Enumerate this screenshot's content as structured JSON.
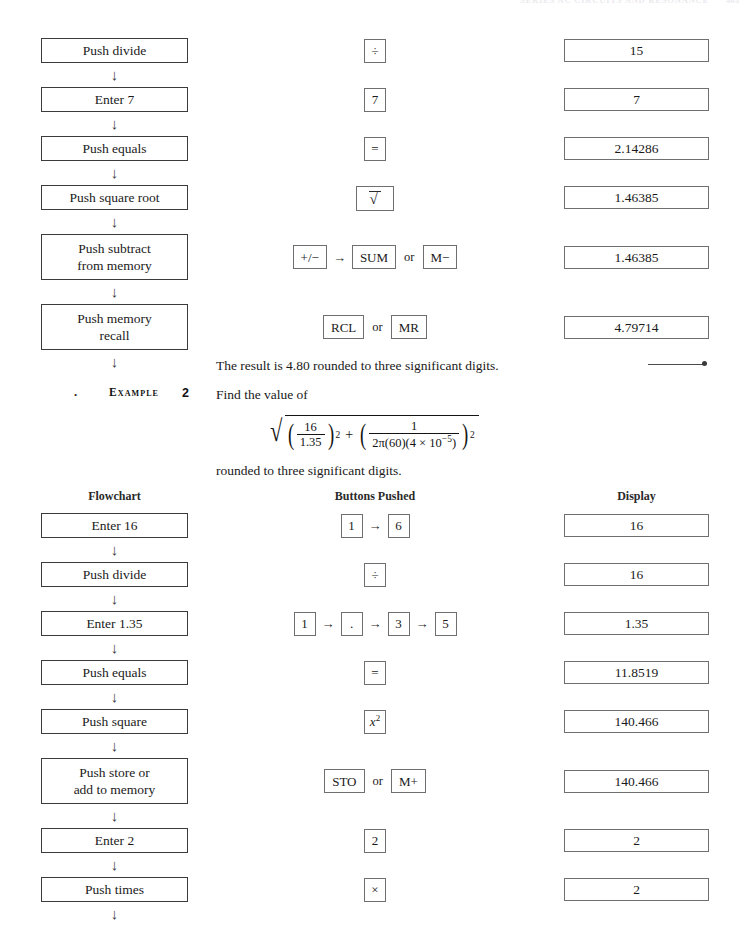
{
  "running_head": {
    "chapter": "CHAPTER 11",
    "title": "SERIES AC CIRCUITS AND RESONANCE",
    "page_number": "403"
  },
  "columns": {
    "flowchart": "Flowchart",
    "buttons": "Buttons Pushed",
    "display": "Display"
  },
  "example1_tail": {
    "rows": [
      {
        "flow": [
          "Push divide"
        ],
        "keys": [
          {
            "type": "key",
            "label": "÷"
          }
        ],
        "display": "15"
      },
      {
        "flow": [
          "Enter 7"
        ],
        "keys": [
          {
            "type": "key",
            "label": "7"
          }
        ],
        "display": "7"
      },
      {
        "flow": [
          "Push equals"
        ],
        "keys": [
          {
            "type": "key",
            "label": "="
          }
        ],
        "display": "2.14286"
      },
      {
        "flow": [
          "Push square root"
        ],
        "keys": [
          {
            "type": "sqrt",
            "label": "√"
          }
        ],
        "display": "1.46385"
      },
      {
        "flow": [
          "Push subtract",
          "from memory"
        ],
        "keys": [
          {
            "type": "key",
            "label": "+/−"
          },
          {
            "type": "arrow",
            "label": "→"
          },
          {
            "type": "key",
            "label": "SUM"
          },
          {
            "type": "or",
            "label": "or"
          },
          {
            "type": "key",
            "label": "M−"
          }
        ],
        "display": "1.46385"
      },
      {
        "flow": [
          "Push memory",
          "recall"
        ],
        "keys": [
          {
            "type": "key",
            "label": "RCL"
          },
          {
            "type": "or",
            "label": "or"
          },
          {
            "type": "key",
            "label": "MR"
          }
        ],
        "display": "4.79714"
      }
    ],
    "result_text": "The result is 4.80 rounded to three significant digits."
  },
  "example2": {
    "bullet": "•",
    "label": "Example",
    "number": "2",
    "prompt": "Find the value of",
    "formula_text": "√((16/1.35)² + (1/(2π(60)(4 × 10⁻⁵)))²)",
    "formula_parts": {
      "frac1_num": "16",
      "frac1_den": "1.35",
      "frac2_num": "1",
      "frac2_den": "2π(60)(4 × 10",
      "frac2_den_exp": "−5",
      "frac2_den_tail": ")",
      "exponent": "2",
      "plus": "+"
    },
    "after_formula": "rounded to three significant digits.",
    "rows": [
      {
        "flow": [
          "Enter 16"
        ],
        "keys": [
          {
            "type": "key",
            "label": "1"
          },
          {
            "type": "arrow",
            "label": "→"
          },
          {
            "type": "key",
            "label": "6"
          }
        ],
        "display": "16"
      },
      {
        "flow": [
          "Push divide"
        ],
        "keys": [
          {
            "type": "key",
            "label": "÷"
          }
        ],
        "display": "16"
      },
      {
        "flow": [
          "Enter 1.35"
        ],
        "keys": [
          {
            "type": "key",
            "label": "1"
          },
          {
            "type": "arrow",
            "label": "→"
          },
          {
            "type": "key",
            "label": "."
          },
          {
            "type": "arrow",
            "label": "→"
          },
          {
            "type": "key",
            "label": "3"
          },
          {
            "type": "arrow",
            "label": "→"
          },
          {
            "type": "key",
            "label": "5"
          }
        ],
        "display": "1.35"
      },
      {
        "flow": [
          "Push equals"
        ],
        "keys": [
          {
            "type": "key",
            "label": "="
          }
        ],
        "display": "11.8519"
      },
      {
        "flow": [
          "Push square"
        ],
        "keys": [
          {
            "type": "xsq",
            "label": "x²"
          }
        ],
        "display": "140.466"
      },
      {
        "flow": [
          "Push store or",
          "add to memory"
        ],
        "keys": [
          {
            "type": "key",
            "label": "STO"
          },
          {
            "type": "or",
            "label": "or"
          },
          {
            "type": "key",
            "label": "M+"
          }
        ],
        "display": "140.466"
      },
      {
        "flow": [
          "Enter 2"
        ],
        "keys": [
          {
            "type": "key",
            "label": "2"
          }
        ],
        "display": "2"
      },
      {
        "flow": [
          "Push times"
        ],
        "keys": [
          {
            "type": "key",
            "label": "×"
          }
        ],
        "display": "2"
      }
    ]
  }
}
